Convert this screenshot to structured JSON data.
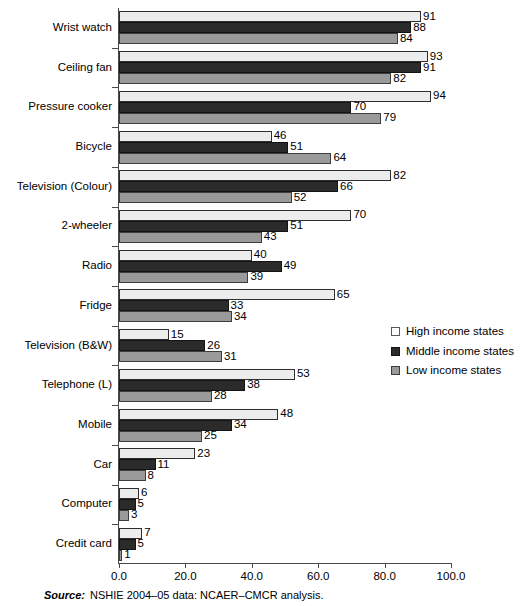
{
  "chart_data": {
    "type": "bar",
    "orientation": "horizontal",
    "title": "",
    "xlabel": "",
    "ylabel": "",
    "xlim": [
      0.0,
      100.0
    ],
    "xticks": [
      "0.0",
      "20.0",
      "40.0",
      "60.0",
      "80.0",
      "100.0"
    ],
    "xtick_values": [
      0,
      20,
      40,
      60,
      80,
      100
    ],
    "grid": false,
    "legend_position": "right-middle",
    "categories": [
      "Wrist watch",
      "Ceiling fan",
      "Pressure cooker",
      "Bicycle",
      "Television (Colour)",
      "2-wheeler",
      "Radio",
      "Fridge",
      "Television (B&W)",
      "Telephone (L)",
      "Mobile",
      "Car",
      "Computer",
      "Credit card"
    ],
    "series": [
      {
        "name": "High income states",
        "key": "high",
        "color": "#ececec",
        "values": [
          91,
          93,
          94,
          46,
          82,
          70,
          40,
          65,
          15,
          53,
          48,
          23,
          6,
          7
        ]
      },
      {
        "name": "Middle income states",
        "key": "middle",
        "color": "#2b2b2b",
        "values": [
          88,
          91,
          70,
          51,
          66,
          51,
          49,
          33,
          26,
          38,
          34,
          11,
          5,
          5
        ]
      },
      {
        "name": "Low income states",
        "key": "low",
        "color": "#9a9a9a",
        "values": [
          84,
          82,
          79,
          64,
          52,
          43,
          39,
          34,
          31,
          28,
          25,
          8,
          3,
          1
        ]
      }
    ]
  },
  "legend": {
    "items": [
      {
        "label": "High income states",
        "key": "high"
      },
      {
        "label": "Middle income states",
        "key": "middle"
      },
      {
        "label": "Low income states",
        "key": "low"
      }
    ]
  },
  "source": {
    "label": "Source:",
    "text": "NSHIE 2004–05 data: NCAER–CMCR analysis."
  }
}
